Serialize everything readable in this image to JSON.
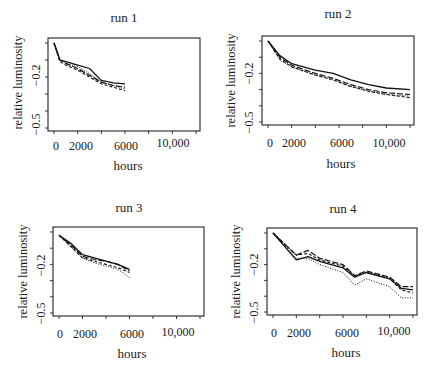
{
  "chart_data": [
    {
      "type": "line",
      "title": "run 1",
      "xlabel": "hours",
      "ylabel": "relative luminosity",
      "xticks": [
        "0",
        "2000",
        "6000",
        "10,000"
      ],
      "yticks": [
        "-0.2",
        "-0.5"
      ],
      "xlim": [
        0,
        12000
      ],
      "ylim": [
        -0.5,
        0.0
      ],
      "grid": false,
      "series": [
        {
          "name": "solid",
          "style": "solid",
          "x": [
            0,
            500,
            1000,
            2000,
            3000,
            4000,
            5000,
            6000
          ],
          "y": [
            0.0,
            -0.1,
            -0.11,
            -0.13,
            -0.15,
            -0.22,
            -0.235,
            -0.24
          ]
        },
        {
          "name": "long-dash",
          "style": "dashed",
          "x": [
            0,
            500,
            1000,
            2000,
            3000,
            4000,
            5000,
            6000
          ],
          "y": [
            0.0,
            -0.1,
            -0.12,
            -0.15,
            -0.19,
            -0.23,
            -0.25,
            -0.26
          ]
        },
        {
          "name": "short-dash",
          "style": "dashed-short",
          "x": [
            0,
            500,
            1000,
            2000,
            3000,
            4000,
            5000,
            6000
          ],
          "y": [
            0.0,
            -0.11,
            -0.13,
            -0.16,
            -0.2,
            -0.24,
            -0.26,
            -0.28
          ]
        },
        {
          "name": "dotted",
          "style": "dotted",
          "x": [
            0,
            500,
            1000,
            2000,
            3000,
            4000,
            5000,
            6000
          ],
          "y": [
            0.0,
            -0.1,
            -0.12,
            -0.14,
            -0.18,
            -0.23,
            -0.25,
            -0.27
          ]
        }
      ]
    },
    {
      "type": "line",
      "title": "run 2",
      "xlabel": "hours",
      "ylabel": "relative luminosity",
      "xticks": [
        "0",
        "2000",
        "6000",
        "10,000"
      ],
      "yticks": [
        "-0.2",
        "-0.5"
      ],
      "xlim": [
        0,
        12000
      ],
      "ylim": [
        -0.5,
        0.0
      ],
      "grid": false,
      "series": [
        {
          "name": "solid",
          "style": "solid",
          "x": [
            0,
            1000,
            2000,
            4000,
            5500,
            7000,
            8500,
            10000,
            12000
          ],
          "y": [
            0.0,
            -0.09,
            -0.14,
            -0.18,
            -0.2,
            -0.24,
            -0.27,
            -0.29,
            -0.3
          ]
        },
        {
          "name": "long-dash",
          "style": "dashed",
          "x": [
            0,
            1000,
            2000,
            4000,
            5500,
            7000,
            8500,
            10000,
            12000
          ],
          "y": [
            0.0,
            -0.1,
            -0.15,
            -0.2,
            -0.23,
            -0.27,
            -0.3,
            -0.32,
            -0.33
          ]
        },
        {
          "name": "short-dash",
          "style": "dashed-short",
          "x": [
            0,
            1000,
            2000,
            4000,
            5500,
            7000,
            8500,
            10000,
            12000
          ],
          "y": [
            0.0,
            -0.11,
            -0.16,
            -0.21,
            -0.24,
            -0.28,
            -0.31,
            -0.33,
            -0.35
          ]
        },
        {
          "name": "dotted",
          "style": "dotted",
          "x": [
            0,
            1000,
            2000,
            4000,
            5500,
            7000,
            8500,
            10000,
            12000
          ],
          "y": [
            0.0,
            -0.12,
            -0.16,
            -0.21,
            -0.24,
            -0.28,
            -0.31,
            -0.33,
            -0.34
          ]
        }
      ]
    },
    {
      "type": "line",
      "title": "run 3",
      "xlabel": "hours",
      "ylabel": "relative luminosity",
      "xticks": [
        "0",
        "2000",
        "6000",
        "10,000"
      ],
      "yticks": [
        "-0.2",
        "-0.5"
      ],
      "xlim": [
        0,
        12000
      ],
      "ylim": [
        -0.5,
        0.0
      ],
      "grid": false,
      "series": [
        {
          "name": "solid",
          "style": "solid",
          "x": [
            0,
            1000,
            2000,
            3000,
            4000,
            5000,
            6000
          ],
          "y": [
            -0.02,
            -0.07,
            -0.14,
            -0.16,
            -0.18,
            -0.2,
            -0.23
          ]
        },
        {
          "name": "long-dash",
          "style": "dashed",
          "x": [
            0,
            1000,
            2000,
            3000,
            4000,
            5000,
            6000
          ],
          "y": [
            -0.02,
            -0.08,
            -0.15,
            -0.17,
            -0.18,
            -0.2,
            -0.24
          ]
        },
        {
          "name": "short-dash",
          "style": "dashed-short",
          "x": [
            0,
            1000,
            2000,
            3000,
            4000,
            5000,
            6000
          ],
          "y": [
            -0.02,
            -0.09,
            -0.16,
            -0.18,
            -0.2,
            -0.22,
            -0.25
          ]
        },
        {
          "name": "dotted",
          "style": "dotted",
          "x": [
            0,
            1000,
            2000,
            3000,
            4000,
            5000,
            6000
          ],
          "y": [
            -0.02,
            -0.09,
            -0.16,
            -0.19,
            -0.21,
            -0.23,
            -0.28
          ]
        }
      ]
    },
    {
      "type": "line",
      "title": "run 4",
      "xlabel": "hours",
      "ylabel": "relative luminosity",
      "xticks": [
        "0",
        "2000",
        "6000",
        "10,000"
      ],
      "yticks": [
        "-0.2",
        "-0.5"
      ],
      "xlim": [
        0,
        12000
      ],
      "ylim": [
        -0.5,
        0.0
      ],
      "grid": false,
      "series": [
        {
          "name": "solid",
          "style": "solid",
          "x": [
            0,
            2000,
            3000,
            4000,
            6000,
            7000,
            8000,
            10000,
            11000,
            12000
          ],
          "y": [
            0.0,
            -0.17,
            -0.15,
            -0.18,
            -0.22,
            -0.28,
            -0.25,
            -0.29,
            -0.35,
            -0.36
          ]
        },
        {
          "name": "long-dash",
          "style": "dashed",
          "x": [
            0,
            2000,
            3000,
            4000,
            6000,
            7000,
            8000,
            10000,
            11000,
            12000
          ],
          "y": [
            0.0,
            -0.14,
            -0.11,
            -0.16,
            -0.2,
            -0.27,
            -0.24,
            -0.28,
            -0.34,
            -0.34
          ]
        },
        {
          "name": "short-dash",
          "style": "dashed-short",
          "x": [
            0,
            2000,
            3000,
            4000,
            6000,
            7000,
            8000,
            10000,
            11000,
            12000
          ],
          "y": [
            0.0,
            -0.14,
            -0.13,
            -0.17,
            -0.21,
            -0.27,
            -0.25,
            -0.29,
            -0.36,
            -0.38
          ]
        },
        {
          "name": "dotted",
          "style": "dotted",
          "x": [
            0,
            2000,
            3000,
            4000,
            6000,
            7000,
            8000,
            10000,
            11000,
            12000
          ],
          "y": [
            0.0,
            -0.16,
            -0.16,
            -0.2,
            -0.25,
            -0.33,
            -0.29,
            -0.34,
            -0.41,
            -0.41
          ]
        }
      ]
    }
  ],
  "panels": [
    {
      "title": "run 1",
      "ylabel": "relative luminosity",
      "xlabel": "hours",
      "yticks": [
        "−0.2",
        "−0.5"
      ],
      "xticks": [
        "0",
        "2000",
        "6000",
        "10,000"
      ]
    },
    {
      "title": "run 2",
      "ylabel": "relative luminosity",
      "xlabel": "hours",
      "yticks": [
        "−0.2",
        "−0.5"
      ],
      "xticks": [
        "0",
        "2000",
        "6000",
        "10,000"
      ]
    },
    {
      "title": "run 3",
      "ylabel": "relative luminosity",
      "xlabel": "hours",
      "yticks": [
        "−0.2",
        "−0.5"
      ],
      "xticks": [
        "0",
        "2000",
        "6000",
        "10,000"
      ]
    },
    {
      "title": "run 4",
      "ylabel": "relative luminosity",
      "xlabel": "hours",
      "yticks": [
        "−0.2",
        "−0.5"
      ],
      "xticks": [
        "0",
        "2000",
        "6000",
        "10,000"
      ]
    }
  ]
}
